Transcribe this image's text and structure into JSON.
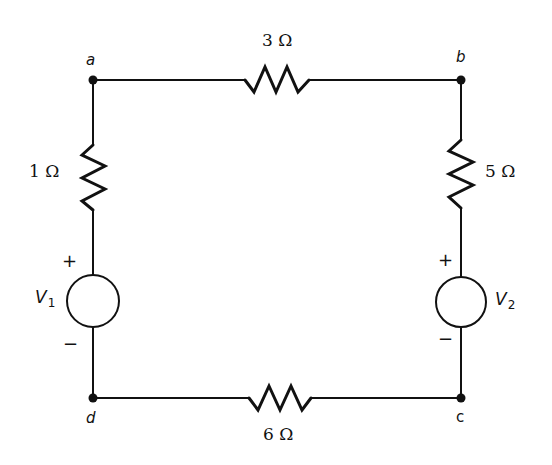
{
  "diagram": {
    "type": "circuit",
    "nodes": [
      {
        "id": "a",
        "label": "a",
        "x": 93,
        "y": 80
      },
      {
        "id": "b",
        "label": "b",
        "x": 461,
        "y": 80
      },
      {
        "id": "c",
        "label": "c",
        "x": 461,
        "y": 398
      },
      {
        "id": "d",
        "label": "d",
        "x": 93,
        "y": 398
      }
    ],
    "resistors": [
      {
        "id": "R_ab",
        "between": [
          "a",
          "b"
        ],
        "label": "3 Ω",
        "value_ohms": 3
      },
      {
        "id": "R_bc",
        "between": [
          "b",
          "c"
        ],
        "label": "5 Ω",
        "value_ohms": 5
      },
      {
        "id": "R_cd",
        "between": [
          "c",
          "d"
        ],
        "label": "6 Ω",
        "value_ohms": 6
      },
      {
        "id": "R_ad",
        "between": [
          "a",
          "d"
        ],
        "label": "1 Ω",
        "value_ohms": 1
      }
    ],
    "sources": [
      {
        "id": "V1",
        "name": "V",
        "sub": "1",
        "branch": [
          "a",
          "d"
        ],
        "plus": "+",
        "minus": "−"
      },
      {
        "id": "V2",
        "name": "V",
        "sub": "2",
        "branch": [
          "b",
          "c"
        ],
        "plus": "+",
        "minus": "−"
      }
    ],
    "colors": {
      "wire": "#111111",
      "background": "#ffffff"
    }
  }
}
